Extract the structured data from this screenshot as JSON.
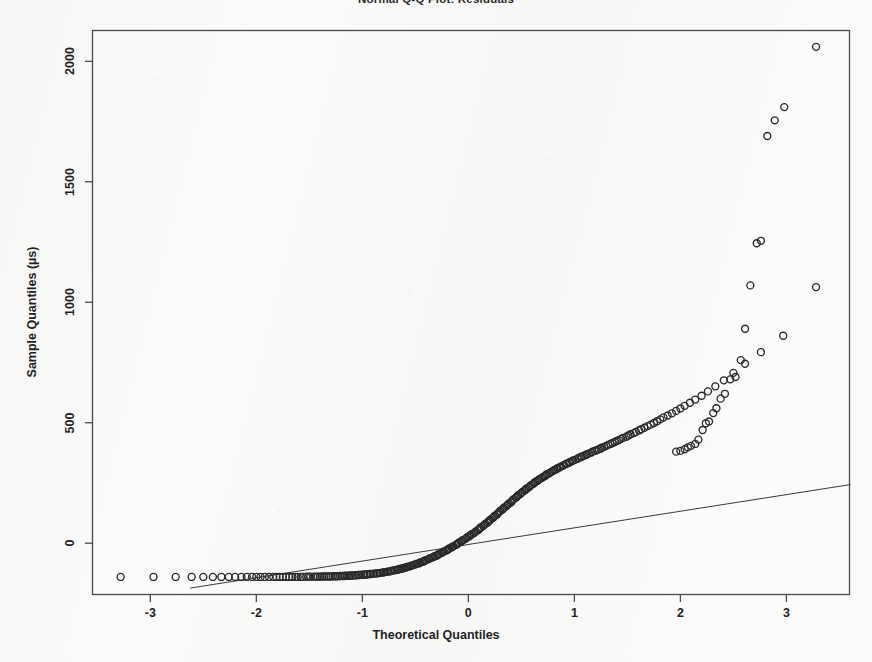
{
  "chart_data": {
    "type": "scatter",
    "title": "Normal Q-Q Plot: Residuals",
    "xlabel": "Theoretical Quantiles",
    "ylabel": "Sample Quantiles (µs)",
    "xlim": [
      -3.55,
      3.6
    ],
    "ylim": [
      -215,
      2130
    ],
    "xticks": [
      -3,
      -2,
      -1,
      0,
      1,
      2,
      3
    ],
    "xtick_labels": [
      "-3",
      "-2",
      "-1",
      "0",
      "1",
      "2",
      "3"
    ],
    "yticks": [
      0,
      500,
      1000,
      1500,
      2000
    ],
    "ytick_labels": [
      "0",
      "500",
      "1000",
      "1500",
      "2000"
    ],
    "grid": false,
    "legend": null,
    "marker": "open-circle",
    "marker_color": "#2a2a2a",
    "marker_size": 7,
    "reference_line": {
      "name": "qqline",
      "color": "#3a3a3a",
      "width": 1,
      "x": [
        -2.62,
        3.6
      ],
      "y": [
        -186,
        243
      ]
    },
    "series": [
      {
        "name": "Residual quantiles",
        "points": [
          [
            -3.28,
            -140
          ],
          [
            -2.97,
            -140
          ],
          [
            -2.76,
            -140
          ],
          [
            -2.61,
            -140
          ],
          [
            -2.5,
            -140
          ],
          [
            -2.41,
            -140
          ],
          [
            -2.33,
            -140
          ],
          [
            -2.26,
            -140
          ],
          [
            -2.2,
            -140
          ],
          [
            -2.14,
            -140
          ],
          [
            -2.09,
            -140
          ],
          [
            -2.04,
            -140
          ],
          [
            -2.0,
            -140
          ],
          [
            -1.96,
            -140
          ],
          [
            -1.92,
            -140
          ],
          [
            -1.88,
            -140
          ],
          [
            -1.84,
            -140
          ],
          [
            -1.81,
            -140
          ],
          [
            -1.78,
            -140
          ],
          [
            -1.75,
            -140
          ],
          [
            -1.72,
            -140
          ],
          [
            -1.69,
            -140
          ],
          [
            -1.66,
            -140
          ],
          [
            -1.63,
            -140
          ],
          [
            -1.61,
            -140
          ],
          [
            -1.58,
            -140
          ],
          [
            -1.56,
            -140
          ],
          [
            -1.53,
            -139
          ],
          [
            -1.51,
            -139
          ],
          [
            -1.49,
            -139
          ],
          [
            -1.46,
            -139
          ],
          [
            -1.44,
            -139
          ],
          [
            -1.42,
            -139
          ],
          [
            -1.4,
            -139
          ],
          [
            -1.38,
            -138
          ],
          [
            -1.36,
            -138
          ],
          [
            -1.34,
            -138
          ],
          [
            -1.32,
            -138
          ],
          [
            -1.3,
            -138
          ],
          [
            -1.28,
            -137
          ],
          [
            -1.26,
            -137
          ],
          [
            -1.25,
            -137
          ],
          [
            -1.23,
            -137
          ],
          [
            -1.21,
            -136
          ],
          [
            -1.19,
            -136
          ],
          [
            -1.17,
            -136
          ],
          [
            -1.16,
            -135
          ],
          [
            -1.14,
            -135
          ],
          [
            -1.12,
            -135
          ],
          [
            -1.11,
            -134
          ],
          [
            -1.09,
            -134
          ],
          [
            -1.07,
            -133
          ],
          [
            -1.06,
            -133
          ],
          [
            -1.04,
            -132
          ],
          [
            -1.03,
            -132
          ],
          [
            -1.01,
            -131
          ],
          [
            -0.99,
            -131
          ],
          [
            -0.98,
            -130
          ],
          [
            -0.96,
            -130
          ],
          [
            -0.95,
            -129
          ],
          [
            -0.93,
            -128
          ],
          [
            -0.92,
            -128
          ],
          [
            -0.9,
            -127
          ],
          [
            -0.89,
            -126
          ],
          [
            -0.87,
            -125
          ],
          [
            -0.86,
            -125
          ],
          [
            -0.84,
            -124
          ],
          [
            -0.83,
            -123
          ],
          [
            -0.81,
            -122
          ],
          [
            -0.8,
            -121
          ],
          [
            -0.79,
            -120
          ],
          [
            -0.77,
            -119
          ],
          [
            -0.76,
            -118
          ],
          [
            -0.74,
            -117
          ],
          [
            -0.73,
            -116
          ],
          [
            -0.72,
            -114
          ],
          [
            -0.7,
            -113
          ],
          [
            -0.69,
            -112
          ],
          [
            -0.67,
            -110
          ],
          [
            -0.66,
            -109
          ],
          [
            -0.65,
            -107
          ],
          [
            -0.63,
            -106
          ],
          [
            -0.62,
            -104
          ],
          [
            -0.61,
            -103
          ],
          [
            -0.59,
            -101
          ],
          [
            -0.58,
            -99
          ],
          [
            -0.57,
            -97
          ],
          [
            -0.55,
            -96
          ],
          [
            -0.54,
            -94
          ],
          [
            -0.53,
            -92
          ],
          [
            -0.51,
            -90
          ],
          [
            -0.5,
            -88
          ],
          [
            -0.49,
            -86
          ],
          [
            -0.47,
            -84
          ],
          [
            -0.46,
            -82
          ],
          [
            -0.45,
            -79
          ],
          [
            -0.43,
            -77
          ],
          [
            -0.42,
            -75
          ],
          [
            -0.41,
            -72
          ],
          [
            -0.4,
            -70
          ],
          [
            -0.38,
            -67
          ],
          [
            -0.37,
            -65
          ],
          [
            -0.36,
            -62
          ],
          [
            -0.34,
            -60
          ],
          [
            -0.33,
            -57
          ],
          [
            -0.32,
            -54
          ],
          [
            -0.3,
            -52
          ],
          [
            -0.29,
            -49
          ],
          [
            -0.28,
            -46
          ],
          [
            -0.27,
            -43
          ],
          [
            -0.25,
            -40
          ],
          [
            -0.24,
            -37
          ],
          [
            -0.23,
            -34
          ],
          [
            -0.21,
            -31
          ],
          [
            -0.2,
            -28
          ],
          [
            -0.19,
            -25
          ],
          [
            -0.18,
            -22
          ],
          [
            -0.16,
            -18
          ],
          [
            -0.15,
            -15
          ],
          [
            -0.14,
            -12
          ],
          [
            -0.12,
            -8
          ],
          [
            -0.11,
            -5
          ],
          [
            -0.1,
            -1
          ],
          [
            -0.09,
            2
          ],
          [
            -0.07,
            6
          ],
          [
            -0.06,
            10
          ],
          [
            -0.05,
            13
          ],
          [
            -0.03,
            17
          ],
          [
            -0.02,
            21
          ],
          [
            -0.01,
            25
          ],
          [
            0.01,
            29
          ],
          [
            0.02,
            33
          ],
          [
            0.03,
            37
          ],
          [
            0.05,
            41
          ],
          [
            0.06,
            45
          ],
          [
            0.07,
            49
          ],
          [
            0.09,
            54
          ],
          [
            0.1,
            58
          ],
          [
            0.11,
            62
          ],
          [
            0.12,
            67
          ],
          [
            0.14,
            71
          ],
          [
            0.15,
            76
          ],
          [
            0.16,
            80
          ],
          [
            0.18,
            85
          ],
          [
            0.19,
            90
          ],
          [
            0.2,
            94
          ],
          [
            0.21,
            99
          ],
          [
            0.23,
            104
          ],
          [
            0.24,
            109
          ],
          [
            0.25,
            114
          ],
          [
            0.27,
            119
          ],
          [
            0.28,
            124
          ],
          [
            0.29,
            129
          ],
          [
            0.3,
            134
          ],
          [
            0.32,
            139
          ],
          [
            0.33,
            144
          ],
          [
            0.34,
            149
          ],
          [
            0.36,
            154
          ],
          [
            0.37,
            159
          ],
          [
            0.38,
            164
          ],
          [
            0.4,
            169
          ],
          [
            0.41,
            174
          ],
          [
            0.42,
            179
          ],
          [
            0.43,
            184
          ],
          [
            0.45,
            189
          ],
          [
            0.46,
            194
          ],
          [
            0.47,
            199
          ],
          [
            0.49,
            204
          ],
          [
            0.5,
            209
          ],
          [
            0.51,
            213
          ],
          [
            0.53,
            218
          ],
          [
            0.54,
            223
          ],
          [
            0.55,
            227
          ],
          [
            0.57,
            232
          ],
          [
            0.58,
            236
          ],
          [
            0.59,
            241
          ],
          [
            0.61,
            245
          ],
          [
            0.62,
            250
          ],
          [
            0.63,
            254
          ],
          [
            0.65,
            258
          ],
          [
            0.66,
            262
          ],
          [
            0.67,
            266
          ],
          [
            0.69,
            270
          ],
          [
            0.7,
            274
          ],
          [
            0.72,
            278
          ],
          [
            0.73,
            282
          ],
          [
            0.74,
            286
          ],
          [
            0.76,
            289
          ],
          [
            0.77,
            293
          ],
          [
            0.79,
            297
          ],
          [
            0.8,
            300
          ],
          [
            0.81,
            304
          ],
          [
            0.83,
            307
          ],
          [
            0.84,
            311
          ],
          [
            0.86,
            314
          ],
          [
            0.87,
            318
          ],
          [
            0.89,
            321
          ],
          [
            0.9,
            324
          ],
          [
            0.92,
            328
          ],
          [
            0.93,
            331
          ],
          [
            0.95,
            334
          ],
          [
            0.96,
            337
          ],
          [
            0.98,
            341
          ],
          [
            0.99,
            344
          ],
          [
            1.01,
            347
          ],
          [
            1.03,
            350
          ],
          [
            1.04,
            354
          ],
          [
            1.06,
            357
          ],
          [
            1.07,
            360
          ],
          [
            1.09,
            363
          ],
          [
            1.11,
            366
          ],
          [
            1.12,
            370
          ],
          [
            1.14,
            373
          ],
          [
            1.16,
            376
          ],
          [
            1.17,
            380
          ],
          [
            1.19,
            383
          ],
          [
            1.21,
            386
          ],
          [
            1.23,
            390
          ],
          [
            1.25,
            393
          ],
          [
            1.26,
            397
          ],
          [
            1.28,
            400
          ],
          [
            1.3,
            404
          ],
          [
            1.32,
            408
          ],
          [
            1.34,
            412
          ],
          [
            1.36,
            416
          ],
          [
            1.38,
            420
          ],
          [
            1.4,
            424
          ],
          [
            1.42,
            428
          ],
          [
            1.44,
            433
          ],
          [
            1.46,
            437
          ],
          [
            1.49,
            442
          ],
          [
            1.51,
            447
          ],
          [
            1.53,
            452
          ],
          [
            1.56,
            457
          ],
          [
            1.58,
            462
          ],
          [
            1.61,
            468
          ],
          [
            1.63,
            473
          ],
          [
            1.66,
            479
          ],
          [
            1.69,
            486
          ],
          [
            1.72,
            492
          ],
          [
            1.75,
            499
          ],
          [
            1.78,
            506
          ],
          [
            1.81,
            514
          ],
          [
            1.84,
            522
          ],
          [
            1.88,
            530
          ],
          [
            1.92,
            539
          ],
          [
            1.96,
            549
          ],
          [
            2.0,
            559
          ],
          [
            2.04,
            570
          ],
          [
            2.09,
            583
          ],
          [
            2.14,
            596
          ],
          [
            2.2,
            612
          ],
          [
            2.26,
            630
          ],
          [
            2.33,
            651
          ],
          [
            2.41,
            676
          ],
          [
            2.5,
            707
          ],
          [
            2.61,
            745
          ],
          [
            2.76,
            793
          ],
          [
            2.97,
            861
          ],
          [
            3.28,
            1063
          ]
        ]
      },
      {
        "name": "Upper tail outliers",
        "points": [
          [
            1.96,
            380
          ],
          [
            2.0,
            383
          ],
          [
            2.04,
            390
          ],
          [
            2.07,
            398
          ],
          [
            2.1,
            404
          ],
          [
            2.14,
            412
          ],
          [
            2.17,
            430
          ],
          [
            2.21,
            470
          ],
          [
            2.24,
            498
          ],
          [
            2.27,
            505
          ],
          [
            2.31,
            540
          ],
          [
            2.34,
            560
          ],
          [
            2.38,
            600
          ],
          [
            2.42,
            620
          ],
          [
            2.47,
            680
          ],
          [
            2.52,
            690
          ],
          [
            2.57,
            760
          ],
          [
            2.61,
            890
          ],
          [
            2.66,
            1070
          ],
          [
            2.72,
            1245
          ],
          [
            2.76,
            1255
          ],
          [
            2.82,
            1690
          ],
          [
            2.89,
            1755
          ],
          [
            2.98,
            1810
          ],
          [
            3.28,
            2060
          ]
        ]
      }
    ]
  }
}
